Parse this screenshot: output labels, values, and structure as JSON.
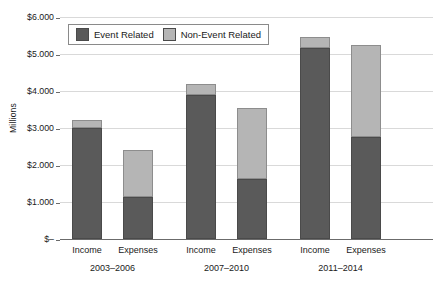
{
  "chart_data": {
    "type": "bar",
    "stacked": true,
    "title": "",
    "xlabel": "",
    "ylabel": "Millions",
    "ylim": [
      0,
      6000
    ],
    "yticks": [
      0,
      1000,
      2000,
      3000,
      4000,
      5000,
      6000
    ],
    "ytick_labels": [
      "$–",
      "$1.000",
      "$2.000",
      "$3.000",
      "$4.000",
      "$5.000",
      "$6.000"
    ],
    "grid": true,
    "legend_position": "upper left inside",
    "categories": [
      "Income",
      "Expenses",
      "Income",
      "Expenses",
      "Income",
      "Expenses"
    ],
    "groups": [
      {
        "label": "2003–2006",
        "categories": [
          "Income",
          "Expenses"
        ]
      },
      {
        "label": "2007–2010",
        "categories": [
          "Income",
          "Expenses"
        ]
      },
      {
        "label": "2011–2014",
        "categories": [
          "Income",
          "Expenses"
        ]
      }
    ],
    "series": [
      {
        "name": "Event Related",
        "color": "#5a5a5a",
        "values": [
          3000,
          1130,
          3890,
          1620,
          5160,
          2760
        ]
      },
      {
        "name": "Non-Event Related",
        "color": "#b5b5b5",
        "values": [
          210,
          1270,
          310,
          1930,
          290,
          2490
        ]
      }
    ],
    "totals": [
      3210,
      2400,
      4200,
      3550,
      5450,
      5250
    ]
  },
  "legend": {
    "items": [
      {
        "label": "Event Related",
        "color": "#5a5a5a"
      },
      {
        "label": "Non-Event Related",
        "color": "#b5b5b5"
      }
    ]
  }
}
